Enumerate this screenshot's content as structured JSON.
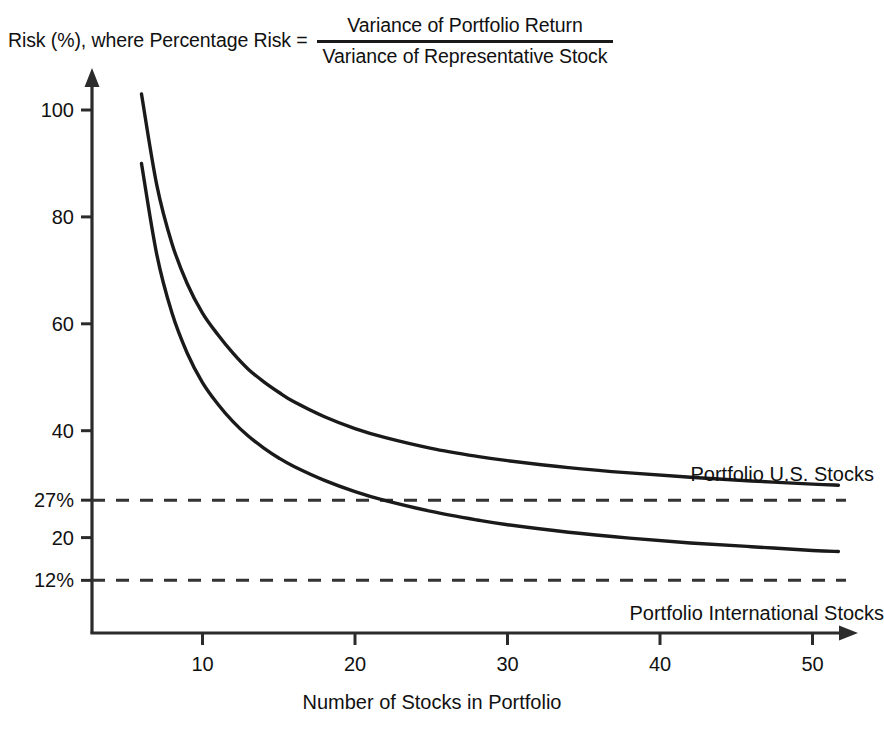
{
  "chart_data": {
    "type": "line",
    "ylabel_parts": {
      "lead": "Risk (%), where Percentage Risk =",
      "numerator": "Variance of Portfolio Return",
      "denominator": "Variance of Representative Stock"
    },
    "xlabel": "Number of Stocks in Portfolio",
    "ylabel": "Risk (%)",
    "xlim": [
      0,
      54
    ],
    "ylim": [
      0,
      108
    ],
    "grid": false,
    "legend_position": "inline-right",
    "xticks": [
      "10",
      "20",
      "30",
      "40",
      "50"
    ],
    "xtick_values": [
      10,
      20,
      30,
      40,
      50
    ],
    "yticks": [
      "100",
      "80",
      "60",
      "40",
      "27%",
      "20",
      "12%"
    ],
    "ytick_values": [
      100,
      80,
      60,
      40,
      27,
      20,
      12
    ],
    "asymptotes": [
      {
        "label": "27%",
        "value": 27,
        "style": "dashed",
        "series": "Portfolio U.S. Stocks"
      },
      {
        "label": "12%",
        "value": 12,
        "style": "dashed",
        "series": "Portfolio International Stocks"
      }
    ],
    "series": [
      {
        "name": "Portfolio U.S. Stocks",
        "label": "Portfolio U.S. Stocks",
        "asymptote": 27,
        "color": "#1a1a1a",
        "x": [
          6,
          7,
          8,
          9,
          10,
          11,
          12,
          13,
          14,
          15,
          16,
          18,
          20,
          22,
          25,
          28,
          30,
          34,
          38,
          42,
          46,
          50,
          51.7
        ],
        "values": [
          103,
          86,
          75,
          67.5,
          62,
          58,
          54.5,
          51.5,
          49.2,
          47.2,
          45.4,
          42.6,
          40.4,
          38.7,
          36.7,
          35.2,
          34.4,
          33.1,
          32.1,
          31.3,
          30.6,
          30.0,
          29.8
        ]
      },
      {
        "name": "Portfolio International Stocks",
        "label": "Portfolio International Stocks",
        "asymptote": 12,
        "color": "#1a1a1a",
        "x": [
          6,
          7,
          8,
          9,
          10,
          11,
          12,
          13,
          14,
          15,
          16,
          18,
          20,
          22,
          25,
          28,
          30,
          34,
          38,
          42,
          46,
          50,
          51.7
        ],
        "values": [
          90,
          73,
          62,
          54.5,
          49,
          45,
          41.7,
          39,
          36.8,
          34.9,
          33.3,
          30.7,
          28.6,
          26.9,
          24.9,
          23.3,
          22.4,
          21.0,
          19.9,
          19.0,
          18.3,
          17.6,
          17.4
        ]
      }
    ],
    "annotations": [
      {
        "text": "Portfolio U.S. Stocks",
        "x": 42,
        "y": 34
      },
      {
        "text": "Portfolio International Stocks",
        "x": 38,
        "y": 8
      }
    ],
    "colors": {
      "line": "#1a1a1a",
      "axis": "#2b2b2b",
      "dashed": "#333333",
      "background": "#ffffff"
    }
  }
}
